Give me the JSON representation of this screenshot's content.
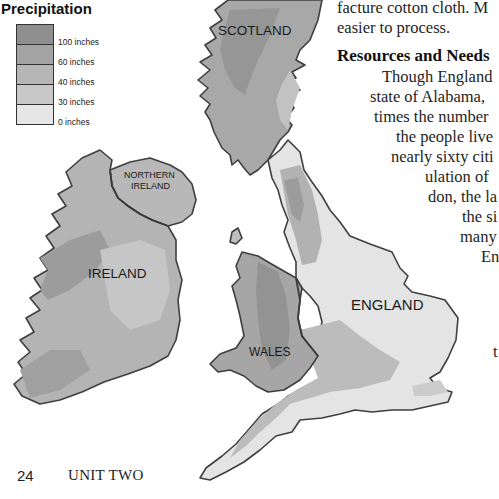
{
  "body_text": {
    "top_lines": [
      "facture cotton cloth. M",
      "easier to process."
    ],
    "heading": "Resources and Needs",
    "paragraph_lines": [
      "Though England",
      "state of Alabama, ",
      "times the number",
      "the people live",
      "nearly sixty citi",
      "ulation of ",
      "don, the la",
      "the si",
      "many",
      "En"
    ],
    "stray_letter": "t"
  },
  "legend": {
    "title": "Precipitation",
    "items": [
      {
        "label": "100 inches",
        "color": "#8f8f8f"
      },
      {
        "label": "60 inches",
        "color": "#a4a4a4"
      },
      {
        "label": "40 inches",
        "color": "#b6b6b6"
      },
      {
        "label": "30 inches",
        "color": "#c8c8c8"
      },
      {
        "label": "0 inches",
        "color": "#e6e6e6"
      }
    ]
  },
  "map": {
    "labels": {
      "scotland": "SCOTLAND",
      "northern_ireland_1": "NORTHERN",
      "northern_ireland_2": "IRELAND",
      "ireland": "IRELAND",
      "england": "ENGLAND",
      "wales": "WALES"
    },
    "colors": {
      "band_100": "#8f8f8f",
      "band_60": "#a4a4a4",
      "band_40": "#b6b6b6",
      "band_30": "#c8c8c8",
      "band_0": "#e6e6e6",
      "outline": "#3f3f3f"
    }
  },
  "footer": {
    "page_number": "24",
    "unit": "UNIT TWO"
  }
}
